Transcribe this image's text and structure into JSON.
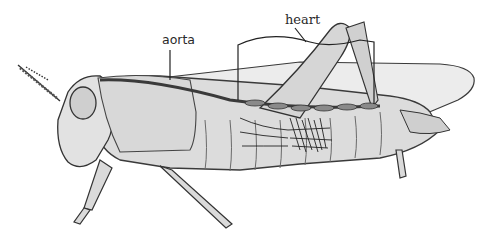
{
  "figure": {
    "background": "#ffffff",
    "body_fill": "#dedede",
    "line_color": "#333333",
    "vessel_color": "#555555",
    "labels": [
      {
        "id": "aorta",
        "text": "aorta"
      },
      {
        "id": "heart",
        "text": "heart"
      }
    ]
  }
}
